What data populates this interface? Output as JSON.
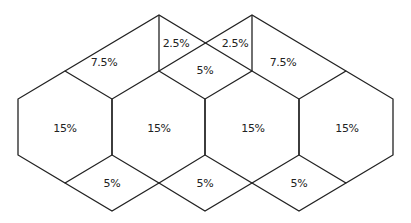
{
  "diagram": {
    "line_color": "#222222",
    "background": "#ffffff",
    "regions": [
      {
        "id": "top-left-trapezoid",
        "label": "7.5%",
        "x": 104,
        "y": 64
      },
      {
        "id": "top-left-triangle",
        "label": "2.5%",
        "x": 179,
        "y": 43
      },
      {
        "id": "top-right-triangle",
        "label": "2.5%",
        "x": 232,
        "y": 43
      },
      {
        "id": "center-diamond",
        "label": "5%",
        "x": 205,
        "y": 68
      },
      {
        "id": "top-right-trapezoid",
        "label": "7.5%",
        "x": 283,
        "y": 64
      },
      {
        "id": "hexagon-1",
        "label": "15%",
        "x": 65,
        "y": 128
      },
      {
        "id": "hexagon-2",
        "label": "15%",
        "x": 159,
        "y": 128
      },
      {
        "id": "hexagon-3",
        "label": "15%",
        "x": 253,
        "y": 128
      },
      {
        "id": "hexagon-4",
        "label": "15%",
        "x": 347,
        "y": 128
      },
      {
        "id": "bottom-diamond-1",
        "label": "5%",
        "x": 112,
        "y": 183
      },
      {
        "id": "bottom-diamond-2",
        "label": "5%",
        "x": 205,
        "y": 183
      },
      {
        "id": "bottom-diamond-3",
        "label": "5%",
        "x": 299,
        "y": 183
      }
    ]
  }
}
